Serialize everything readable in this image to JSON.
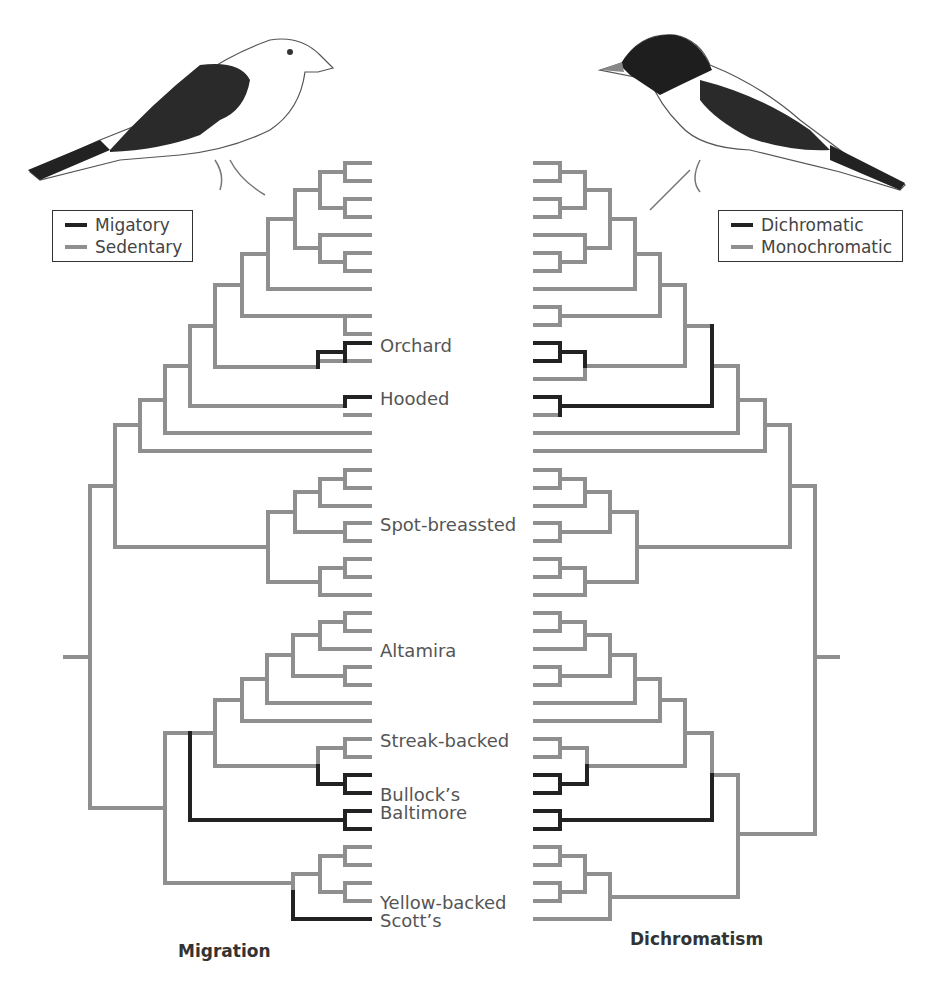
{
  "colors": {
    "gained": "#222222",
    "ancestral": "#8f8f8f",
    "text": "#555555"
  },
  "left_panel": {
    "title": "Migration",
    "legend": [
      {
        "label": "Migatory",
        "color": "#222222"
      },
      {
        "label": "Sedentary",
        "color": "#8f8f8f"
      }
    ],
    "bird_illustration": "pale oriole with dark wings (left-facing tree)"
  },
  "right_panel": {
    "title": "Dichromatism",
    "legend": [
      {
        "label": "Dichromatic",
        "color": "#222222"
      },
      {
        "label": "Monochromatic",
        "color": "#8f8f8f"
      }
    ],
    "bird_illustration": "black-hooded oriole with white underparts"
  },
  "taxa_labels": [
    {
      "leaf_index": 10,
      "label": "Orchard"
    },
    {
      "leaf_index": 13,
      "label": "Hooded"
    },
    {
      "leaf_index": 20,
      "label": "Spot-breassted"
    },
    {
      "leaf_index": 27,
      "label": "Altamira"
    },
    {
      "leaf_index": 32,
      "label": "Streak-backed"
    },
    {
      "leaf_index": 35,
      "label": "Bullock’s"
    },
    {
      "leaf_index": 36,
      "label": "Baltimore"
    },
    {
      "leaf_index": 41,
      "label": "Yellow-backed"
    },
    {
      "leaf_index": 42,
      "label": "Scott’s"
    }
  ],
  "leaf_count": 43,
  "labels": {
    "orchard": "Orchard",
    "hooded": "Hooded",
    "spot": "Spot-breassted",
    "altamira": "Altamira",
    "streak": "Streak-backed",
    "bullocks": "Bullock’s",
    "baltimore": "Baltimore",
    "yellow": "Yellow-backed",
    "scotts": "Scott’s"
  }
}
